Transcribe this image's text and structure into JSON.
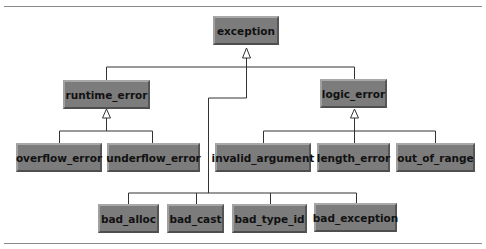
{
  "diagram": {
    "nodes": {
      "exception": "exception",
      "runtime_error": "runtime_error",
      "logic_error": "logic_error",
      "overflow_error": "overflow_error",
      "underflow_error": "underflow_error",
      "invalid_argument": "invalid_argument",
      "length_error": "length_error",
      "out_of_range": "out_of_range",
      "bad_alloc": "bad_alloc",
      "bad_cast": "bad_cast",
      "bad_type_id": "bad_type_id",
      "bad_exception": "bad_exception"
    },
    "colors": {
      "box_fill": "#7c7c7c",
      "line": "#333333",
      "rule": "#8a8a8a"
    }
  }
}
